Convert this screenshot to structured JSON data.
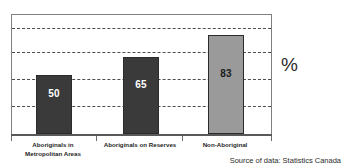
{
  "chart_data": {
    "type": "bar",
    "title": "",
    "subtitle": "",
    "xlabel": "",
    "ylabel": "%",
    "ylim": [
      0,
      100
    ],
    "grid": true,
    "gridlines_at": [
      20,
      40,
      60,
      80
    ],
    "legend": "none",
    "categories": [
      "Aboriginals in Metropolitan Areas",
      "Aboriginals on Reserves",
      "Non-Aboriginal"
    ],
    "values": [
      50,
      65,
      83
    ],
    "series": [
      {
        "name": "",
        "values": [
          50,
          65,
          83
        ]
      }
    ],
    "bars": [
      {
        "category_line1": "Aboriginals in",
        "category_line2": "Metropolitan Areas",
        "value": 50,
        "value_label": "50",
        "fill": "#3a3a3a",
        "label_color": "#ffffff"
      },
      {
        "category_line1": "Aboriginals on Reserves",
        "category_line2": "",
        "value": 65,
        "value_label": "65",
        "fill": "#3a3a3a",
        "label_color": "#ffffff"
      },
      {
        "category_line1": "Non-Aboriginal",
        "category_line2": "",
        "value": 83,
        "value_label": "83",
        "fill": "#9a9a9a",
        "label_color": "#1a1a1a"
      }
    ],
    "annotations": {
      "unit": "%",
      "source": "Source of data: Statistics Canada"
    }
  },
  "colors": {
    "background": "#ffffff",
    "frame": "#808080",
    "gridline": "#4d4d4d",
    "axis": "#595959",
    "bar_dark": "#3a3a3a",
    "bar_light": "#9a9a9a",
    "text": "#1a1a1a"
  }
}
